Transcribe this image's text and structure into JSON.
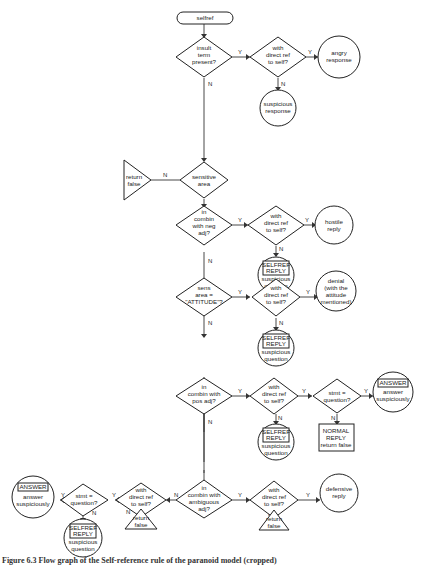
{
  "flowchart": {
    "start": "selfref",
    "nodes": {
      "insult": [
        "insult",
        "term",
        "present?"
      ],
      "insult_direct": [
        "with",
        "direct ref",
        "to self?"
      ],
      "angry": [
        "angry",
        "response"
      ],
      "suspicious_resp": [
        "suspicious",
        "response"
      ],
      "sensitive": [
        "sensitive",
        "area"
      ],
      "return_false_1": [
        "return",
        "false"
      ],
      "neg_adj": [
        "in",
        "combin",
        "with neg",
        "adj?"
      ],
      "neg_direct": [
        "with",
        "direct ref",
        "to self?"
      ],
      "hostile": [
        "hostile",
        "reply"
      ],
      "selfref_1": {
        "box": [
          "SELFREF",
          "REPLY"
        ],
        "text": [
          "suspicious",
          "question"
        ]
      },
      "attitude": [
        "sens",
        "area =",
        "\"ATTITUDE\"?"
      ],
      "attitude_direct": [
        "with",
        "direct ref",
        "to self?"
      ],
      "denial": [
        "denial",
        "(with the",
        "attitude",
        "mentioned)"
      ],
      "selfref_2": {
        "box": [
          "SELFREF",
          "REPLY"
        ],
        "text": [
          "suspicious",
          "question"
        ]
      },
      "pos_adj": [
        "in",
        "combin with",
        "pos adj?"
      ],
      "pos_direct": [
        "with",
        "direct ref",
        "to self?"
      ],
      "stmt_q_1": [
        "stmt =",
        "question?"
      ],
      "answer_1": {
        "box": [
          "ANSWER"
        ],
        "text": [
          "answer",
          "suspiciously"
        ]
      },
      "normal_reply": [
        "NORMAL",
        "REPLY",
        "return false"
      ],
      "selfref_3": {
        "box": [
          "SELFREF",
          "REPLY"
        ],
        "text": [
          "suspicious",
          "question"
        ]
      },
      "amb_adj": [
        "in",
        "combin with",
        "ambiguous",
        "adj?"
      ],
      "amb_direct_right": [
        "with",
        "direct ref",
        "to self?"
      ],
      "defensive": [
        "defensive",
        "reply"
      ],
      "return_false_3": [
        "return",
        "false"
      ],
      "amb_direct_left": [
        "with",
        "direct ref",
        "to self?"
      ],
      "return_false_2": [
        "return",
        "false"
      ],
      "stmt_q_2": [
        "stmt =",
        "question?"
      ],
      "answer_2": {
        "box": [
          "ANSWER"
        ],
        "text": [
          "answer",
          "suspiciously"
        ]
      },
      "selfref_4": {
        "box": [
          "SELFREF",
          "REPLY"
        ],
        "text": [
          "suspicious",
          "question"
        ]
      }
    },
    "edge_labels": {
      "yes": "Y",
      "no": "N"
    }
  },
  "caption": "Figure 6.3  Flow graph of the Self-reference rule of the paranoid model (cropped)"
}
